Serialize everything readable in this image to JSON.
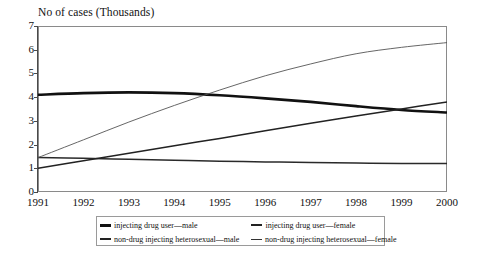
{
  "chart_data": {
    "type": "line",
    "title": "No of cases (Thousands)",
    "xlabel": "",
    "ylabel": "No of cases (Thousands)",
    "x": [
      1991,
      1992,
      1993,
      1994,
      1995,
      1996,
      1997,
      1998,
      1999,
      2000
    ],
    "categories": [
      "1991",
      "1992",
      "1993",
      "1994",
      "1995",
      "1996",
      "1997",
      "1998",
      "1999",
      "2000"
    ],
    "xlim": [
      1991,
      2000
    ],
    "ylim": [
      0,
      7
    ],
    "yticks": [
      0,
      1,
      2,
      3,
      4,
      5,
      6,
      7
    ],
    "grid": false,
    "legend_position": "bottom",
    "series": [
      {
        "name": "injecting drug user—male",
        "style": "thick",
        "color": "#111111",
        "values": [
          4.1,
          4.17,
          4.2,
          4.17,
          4.08,
          3.95,
          3.8,
          3.62,
          3.46,
          3.35
        ]
      },
      {
        "name": "injecting drug user—female",
        "style": "medium",
        "color": "#2a2a2a",
        "values": [
          1.45,
          1.42,
          1.38,
          1.34,
          1.3,
          1.27,
          1.24,
          1.22,
          1.2,
          1.2
        ]
      },
      {
        "name": "non-drug injecting heterosexual—male",
        "style": "medium",
        "color": "#222222",
        "values": [
          1.0,
          1.32,
          1.63,
          1.95,
          2.26,
          2.58,
          2.9,
          3.2,
          3.5,
          3.8
        ]
      },
      {
        "name": "non-drug injecting heterosexual—female",
        "style": "thin",
        "color": "#555555",
        "values": [
          1.45,
          2.2,
          2.95,
          3.65,
          4.3,
          4.9,
          5.4,
          5.83,
          6.1,
          6.3
        ]
      }
    ]
  },
  "legend": {
    "entries": [
      {
        "label": "injecting drug user—male",
        "swatch": "thick"
      },
      {
        "label": "injecting drug user—female",
        "swatch": "medium"
      },
      {
        "label": "non-drug injecting heterosexual—male",
        "swatch": "medium"
      },
      {
        "label": "non-drug injecting heterosexual—female",
        "swatch": "thin"
      }
    ]
  }
}
